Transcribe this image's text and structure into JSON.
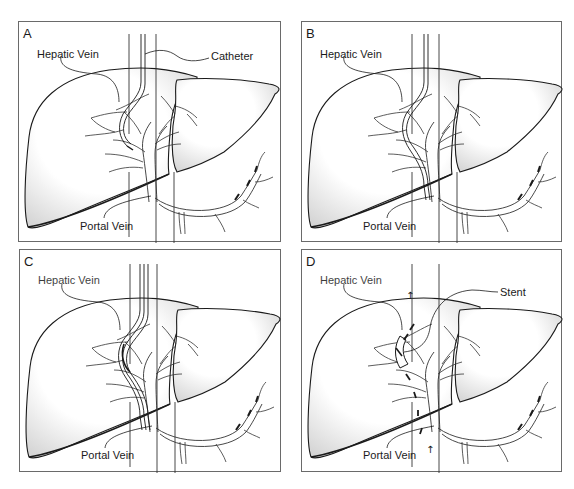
{
  "figure": {
    "panels": [
      {
        "id": "A",
        "letter": "A",
        "labels": {
          "hepatic_vein": "Hepatic Vein",
          "catheter": "Catheter",
          "portal_vein": "Portal Vein"
        },
        "stage": "catheter"
      },
      {
        "id": "B",
        "letter": "B",
        "labels": {
          "hepatic_vein": "Hepatic Vein",
          "portal_vein": "Portal Vein"
        },
        "stage": "guidewire-tract"
      },
      {
        "id": "C",
        "letter": "C",
        "labels": {
          "hepatic_vein": "Hepatic Vein",
          "portal_vein": "Portal Vein"
        },
        "stage": "dilated-tract"
      },
      {
        "id": "D",
        "letter": "D",
        "labels": {
          "hepatic_vein": "Hepatic Vein",
          "stent": "Stent",
          "portal_vein": "Portal Vein"
        },
        "stage": "stent-flow",
        "flow_arrow_glyph": "↑"
      }
    ],
    "colors": {
      "outline": "#1a1a1a",
      "frame": "#6a6a6a",
      "shade": "#d9d9d9",
      "background": "#ffffff"
    }
  }
}
